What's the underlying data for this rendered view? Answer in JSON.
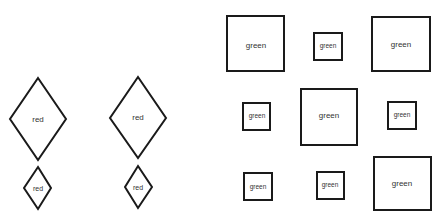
{
  "diamonds": [
    {
      "label": "red",
      "size": "large"
    },
    {
      "label": "red",
      "size": "small"
    },
    {
      "label": "red",
      "size": "large"
    },
    {
      "label": "red",
      "size": "small"
    }
  ],
  "squares": [
    {
      "label": "green",
      "size": "large"
    },
    {
      "label": "green",
      "size": "small"
    },
    {
      "label": "green",
      "size": "large"
    },
    {
      "label": "green",
      "size": "small"
    },
    {
      "label": "green",
      "size": "large"
    },
    {
      "label": "green",
      "size": "small"
    },
    {
      "label": "green",
      "size": "small"
    },
    {
      "label": "green",
      "size": "small"
    },
    {
      "label": "green",
      "size": "large"
    }
  ]
}
